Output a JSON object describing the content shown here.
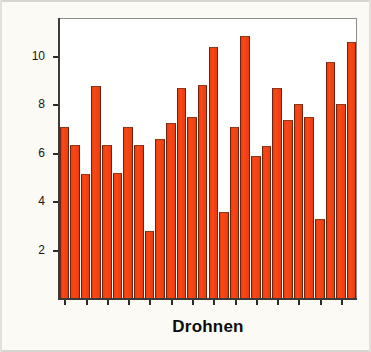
{
  "figure": {
    "background_color": "#fbfaf5",
    "plot_background_color": "#ffffff"
  },
  "chart_data": {
    "type": "bar",
    "title": "",
    "xlabel": "Drohnen",
    "ylabel": "Anzahl Spermien in Millionen",
    "ylim": [
      0,
      11.6
    ],
    "yticks": [
      2,
      4,
      6,
      8,
      10
    ],
    "ytick_labels": [
      "2",
      "4",
      "6",
      "8",
      "10"
    ],
    "grid": false,
    "legend": null,
    "bar_color": "#f2400d",
    "bar_edge_color": "#6b2410",
    "categories": [
      "1",
      "2",
      "3",
      "4",
      "5",
      "6",
      "7",
      "8",
      "9",
      "10",
      "11",
      "12",
      "13",
      "14",
      "15",
      "16",
      "17",
      "18",
      "19",
      "20",
      "21",
      "22",
      "23",
      "24",
      "25",
      "26",
      "27"
    ],
    "values": [
      7.1,
      6.35,
      5.15,
      8.8,
      6.35,
      5.2,
      7.1,
      6.35,
      2.8,
      6.6,
      7.25,
      8.7,
      7.5,
      8.85,
      10.4,
      3.6,
      7.1,
      10.85,
      5.9,
      6.3,
      8.7,
      7.4,
      8.05,
      7.5,
      3.3,
      9.8,
      8.05
    ],
    "extra_values": [
      10.6
    ]
  }
}
